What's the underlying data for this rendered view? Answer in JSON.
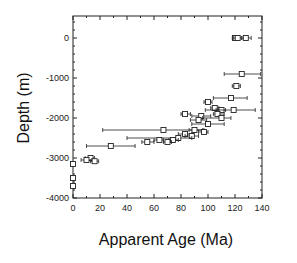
{
  "chart_data": {
    "type": "scatter",
    "title": "",
    "xlabel": "Apparent Age (Ma)",
    "ylabel": "Depth (m)",
    "xlim": [
      0,
      140
    ],
    "ylim": [
      -4000,
      550
    ],
    "xticks": [
      0,
      20,
      40,
      60,
      80,
      100,
      120,
      140
    ],
    "yticks": [
      0,
      -1000,
      -2000,
      -3000,
      -4000
    ],
    "grid": false,
    "legend": null,
    "marker": "open-square",
    "series": [
      {
        "name": "samples",
        "points": [
          {
            "x": 120,
            "y": 0,
            "xerr": [
              118,
              123
            ]
          },
          {
            "x": 122,
            "y": 0,
            "xerr": [
              119,
              125
            ]
          },
          {
            "x": 128,
            "y": 0,
            "xerr": [
              125,
              132
            ]
          },
          {
            "x": 125,
            "y": -900,
            "xerr": [
              112,
              139
            ]
          },
          {
            "x": 121,
            "y": -1200,
            "xerr": [
              118,
              124
            ]
          },
          {
            "x": 117,
            "y": -1500,
            "xerr": [
              104,
              129
            ]
          },
          {
            "x": 100,
            "y": -1600,
            "xerr": [
              97,
              103
            ]
          },
          {
            "x": 105,
            "y": -1750,
            "xerr": [
              102,
              108
            ]
          },
          {
            "x": 110,
            "y": -1800,
            "xerr": [
              106,
              113
            ]
          },
          {
            "x": 119,
            "y": -1800,
            "xerr": [
              98,
              135
            ]
          },
          {
            "x": 107,
            "y": -1900,
            "xerr": [
              104,
              112
            ]
          },
          {
            "x": 83,
            "y": -1900,
            "xerr": [
              80,
              87
            ]
          },
          {
            "x": 95,
            "y": -1950,
            "xerr": [
              88,
              102
            ]
          },
          {
            "x": 110,
            "y": -2000,
            "xerr": [
              96,
              117
            ]
          },
          {
            "x": 93,
            "y": -2050,
            "xerr": [
              87,
              99
            ]
          },
          {
            "x": 100,
            "y": -2150,
            "xerr": [
              88,
              112
            ]
          },
          {
            "x": 67,
            "y": -2300,
            "xerr": [
              22,
              97
            ]
          },
          {
            "x": 90,
            "y": -2300,
            "xerr": [
              86,
              96
            ]
          },
          {
            "x": 97,
            "y": -2350,
            "xerr": [
              93,
              100
            ]
          },
          {
            "x": 83,
            "y": -2400,
            "xerr": [
              78,
              88
            ]
          },
          {
            "x": 88,
            "y": -2450,
            "xerr": [
              83,
              93
            ]
          },
          {
            "x": 78,
            "y": -2500,
            "xerr": [
              40,
              88
            ]
          },
          {
            "x": 64,
            "y": -2550,
            "xerr": [
              60,
              67
            ]
          },
          {
            "x": 74,
            "y": -2550,
            "xerr": [
              71,
              78
            ]
          },
          {
            "x": 55,
            "y": -2600,
            "xerr": [
              51,
              60
            ]
          },
          {
            "x": 70,
            "y": -2600,
            "xerr": [
              67,
              73
            ]
          },
          {
            "x": 28,
            "y": -2700,
            "xerr": [
              10,
              46
            ]
          },
          {
            "x": 13,
            "y": -3000,
            "xerr": [
              9,
              16
            ]
          },
          {
            "x": 10,
            "y": -3050,
            "xerr": [
              6,
              14
            ]
          },
          {
            "x": 16,
            "y": -3080,
            "xerr": [
              13,
              19
            ]
          },
          {
            "x": 0,
            "y": -3150,
            "xerr": [
              0,
              0
            ]
          },
          {
            "x": 0,
            "y": -3500,
            "xerr": [
              0,
              0
            ]
          },
          {
            "x": 0,
            "y": -3700,
            "xerr": [
              0,
              0
            ]
          }
        ]
      }
    ]
  },
  "figure": {
    "ylabel": "Depth (m)",
    "xlabel": "Apparent Age (Ma)",
    "plot_box": {
      "left": 73,
      "right": 262,
      "top": 16,
      "bottom": 198
    },
    "colors": {
      "axis": "#222222",
      "marker": "#222222",
      "background": "#ffffff"
    }
  }
}
